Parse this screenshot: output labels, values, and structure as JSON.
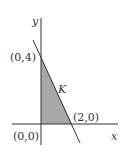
{
  "diagram": {
    "axes": {
      "x_label": "x",
      "y_label": "y"
    },
    "points": {
      "origin": "(0,0)",
      "y_intercept": "(0,4)",
      "x_intercept": "(2,0)"
    },
    "region_label": "K",
    "colors": {
      "region_fill": "#a8a8a8",
      "lines": "#333333",
      "background": "#ffffff"
    }
  }
}
